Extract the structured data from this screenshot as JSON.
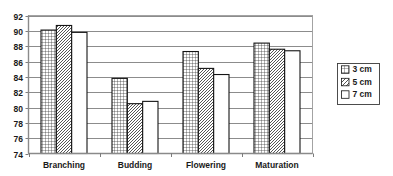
{
  "chart_data": {
    "type": "bar",
    "title": "",
    "subtitle": "",
    "xlabel": "",
    "ylabel": "",
    "categories": [
      "Branching",
      "Budding",
      "Flowering",
      "Maturation"
    ],
    "series": [
      {
        "name": "3 cm",
        "pattern": "cross-hatch",
        "values": [
          90.1,
          83.8,
          87.3,
          88.4
        ]
      },
      {
        "name": "5 cm",
        "pattern": "diagonal-hatch",
        "values": [
          90.7,
          80.5,
          85.1,
          87.6
        ]
      },
      {
        "name": "7 cm",
        "pattern": "solid-white",
        "values": [
          89.8,
          80.8,
          84.3,
          87.4
        ]
      }
    ],
    "ylim": [
      74,
      92
    ],
    "yticks": [
      74,
      76,
      78,
      80,
      82,
      84,
      86,
      88,
      90,
      92
    ],
    "ytick_labels": [
      "74",
      "76",
      "78",
      "80",
      "82",
      "84",
      "86",
      "88",
      "90",
      "92"
    ],
    "grid": true,
    "grid_axis": "y",
    "legend_position": "right",
    "legend_entries": [
      "3 cm",
      "5 cm",
      "7 cm"
    ],
    "colors": {
      "bar_outline": "#141414",
      "gridline": "#6e6e6e",
      "axis": "#8a8a8a",
      "text": "#1a1a1a",
      "background": "#ffffff"
    }
  }
}
